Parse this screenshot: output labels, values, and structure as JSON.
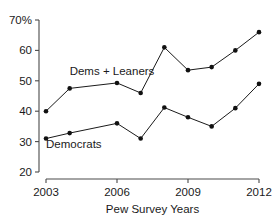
{
  "chart_data": {
    "type": "line",
    "title": "",
    "xlabel": "Pew Survey Years",
    "ylabel": "",
    "x": [
      2003,
      2004,
      2006,
      2007,
      2008,
      2009,
      2010,
      2011,
      2012
    ],
    "xlim": [
      2003,
      2012
    ],
    "ylim": [
      20,
      70
    ],
    "grid": false,
    "legend_position": "inline-annotations",
    "x_ticks": [
      "2003",
      "2006",
      "2009",
      "2012"
    ],
    "x_tick_values": [
      2003,
      2006,
      2009,
      2012
    ],
    "y_ticks": [
      "20",
      "30",
      "40",
      "50",
      "60",
      "70%"
    ],
    "y_tick_values": [
      20,
      30,
      40,
      50,
      60,
      70
    ],
    "series": [
      {
        "name": "Dems + Leaners",
        "values": [
          40,
          47.5,
          49.3,
          46,
          61,
          53.5,
          54.5,
          60,
          66
        ],
        "annotation": "Dems + Leaners",
        "color": "#1a1a1a"
      },
      {
        "name": "Democrats",
        "values": [
          31,
          32.8,
          36,
          31,
          41.2,
          38,
          35,
          41,
          49
        ],
        "annotation": "Democrats",
        "color": "#1a1a1a"
      }
    ],
    "annotations": [
      {
        "text": "Dems + Leaners",
        "x": 2004.0,
        "y": 52.0
      },
      {
        "text": "Democrats",
        "x": 2003.0,
        "y": 28.0
      }
    ]
  }
}
